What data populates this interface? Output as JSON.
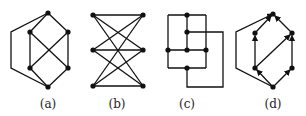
{
  "figure": {
    "panels": [
      {
        "id": "a",
        "label": "(a)",
        "nodes": [
          [
            48,
            13
          ],
          [
            30,
            32
          ],
          [
            68,
            32
          ],
          [
            30,
            68
          ],
          [
            68,
            68
          ],
          [
            48,
            87
          ]
        ],
        "edges": [
          [
            0,
            1
          ],
          [
            0,
            2
          ],
          [
            1,
            3
          ],
          [
            2,
            4
          ],
          [
            1,
            4
          ],
          [
            2,
            3
          ],
          [
            3,
            5
          ],
          [
            4,
            5
          ]
        ],
        "outer_path": [
          [
            48,
            13
          ],
          [
            11,
            32
          ],
          [
            11,
            68
          ],
          [
            48,
            87
          ]
        ]
      },
      {
        "id": "b",
        "label": "(b)",
        "nodes": [
          [
            93,
            15
          ],
          [
            93,
            50
          ],
          [
            93,
            86
          ],
          [
            143,
            15
          ],
          [
            143,
            50
          ],
          [
            143,
            86
          ]
        ],
        "edges": [
          [
            0,
            3
          ],
          [
            0,
            4
          ],
          [
            0,
            5
          ],
          [
            1,
            3
          ],
          [
            1,
            4
          ],
          [
            1,
            5
          ],
          [
            2,
            3
          ],
          [
            2,
            4
          ],
          [
            2,
            5
          ]
        ]
      },
      {
        "id": "c",
        "label": "(c)",
        "nodes": [
          [
            187,
            15
          ],
          [
            187,
            32
          ],
          [
            168,
            50
          ],
          [
            187,
            50
          ],
          [
            206,
            50
          ],
          [
            187,
            68
          ]
        ],
        "segments": [
          [
            [
              168,
              15
            ],
            [
              206,
              15
            ]
          ],
          [
            [
              168,
              15
            ],
            [
              168,
              68
            ]
          ],
          [
            [
              206,
              15
            ],
            [
              206,
              68
            ]
          ],
          [
            [
              168,
              68
            ],
            [
              206,
              68
            ]
          ],
          [
            [
              187,
              15
            ],
            [
              187,
              50
            ]
          ],
          [
            [
              168,
              50
            ],
            [
              206,
              50
            ]
          ],
          [
            [
              187,
              32
            ],
            [
              223,
              32
            ],
            [
              223,
              87
            ],
            [
              187,
              87
            ],
            [
              187,
              68
            ]
          ]
        ]
      },
      {
        "id": "d",
        "label": "(d)",
        "nodes": [
          [
            273,
            14
          ],
          [
            255,
            33
          ],
          [
            292,
            33
          ],
          [
            255,
            68
          ],
          [
            292,
            68
          ],
          [
            273,
            87
          ]
        ],
        "arcs": [
          [
            5,
            3
          ],
          [
            5,
            4
          ],
          [
            3,
            1
          ],
          [
            3,
            2
          ],
          [
            1,
            0
          ],
          [
            2,
            0
          ],
          [
            4,
            2
          ]
        ],
        "outer_path": [
          [
            273,
            87
          ],
          [
            236,
            68
          ],
          [
            236,
            32
          ],
          [
            273,
            14
          ]
        ]
      }
    ]
  }
}
